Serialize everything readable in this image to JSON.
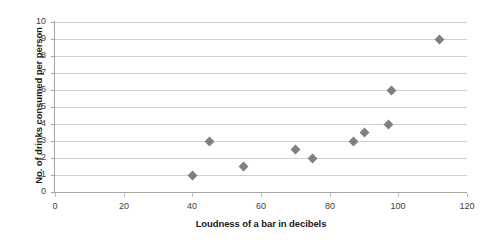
{
  "chart_data": {
    "type": "scatter",
    "title": "",
    "xlabel": "Loudness of a bar in decibels",
    "ylabel": "No. of drinks consumed per person",
    "xlim": [
      0,
      120
    ],
    "ylim": [
      0,
      10
    ],
    "x_ticks": [
      0,
      20,
      40,
      60,
      80,
      100,
      120
    ],
    "y_ticks": [
      0,
      1,
      2,
      3,
      4,
      5,
      6,
      7,
      8,
      9,
      10
    ],
    "grid": "horizontal",
    "legend": "none",
    "marker": "diamond",
    "marker_color": "#808080",
    "points": [
      {
        "x": 40,
        "y": 1
      },
      {
        "x": 45,
        "y": 3
      },
      {
        "x": 55,
        "y": 1.5
      },
      {
        "x": 70,
        "y": 2.5
      },
      {
        "x": 75,
        "y": 2
      },
      {
        "x": 87,
        "y": 3
      },
      {
        "x": 90,
        "y": 3.5
      },
      {
        "x": 97,
        "y": 4
      },
      {
        "x": 98,
        "y": 6
      },
      {
        "x": 112,
        "y": 9
      }
    ]
  },
  "colors": {
    "marker": "#808080",
    "gridline": "#d0d0d0",
    "axis": "#a6a6a6",
    "label_text": "#404040",
    "title_text": "#1a1a1a",
    "background": "#ffffff"
  }
}
